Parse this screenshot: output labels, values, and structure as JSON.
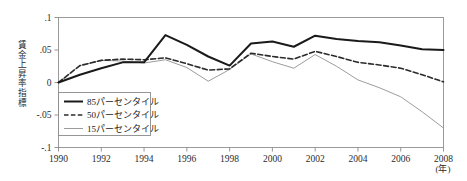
{
  "chart_data": {
    "type": "line",
    "title": "",
    "xlabel": "(年)",
    "ylabel": "賃金上昇率指標",
    "xlim": [
      1990,
      2008
    ],
    "ylim": [
      -0.1,
      0.1
    ],
    "grid": false,
    "legend_position": "lower-left-inside",
    "x": [
      1990,
      1991,
      1992,
      1993,
      1994,
      1995,
      1996,
      1997,
      1998,
      1999,
      2000,
      2001,
      2002,
      2003,
      2004,
      2005,
      2006,
      2007,
      2008
    ],
    "xticks": [
      "1990",
      "1992",
      "1994",
      "1996",
      "1998",
      "2000",
      "2002",
      "2004",
      "2006",
      "2008"
    ],
    "xtick_values": [
      1990,
      1992,
      1994,
      1996,
      1998,
      2000,
      2002,
      2004,
      2006,
      2008
    ],
    "yticks": [
      ".1",
      ".05",
      "0",
      "-.05",
      "-.1"
    ],
    "ytick_values": [
      0.1,
      0.05,
      0,
      -0.05,
      -0.1
    ],
    "series": [
      {
        "name": "85パーセンタイル",
        "style": "solid-thick",
        "color": "#1a1a1a",
        "values": [
          0.0,
          0.012,
          0.022,
          0.031,
          0.031,
          0.073,
          0.058,
          0.04,
          0.026,
          0.06,
          0.063,
          0.055,
          0.072,
          0.067,
          0.064,
          0.062,
          0.057,
          0.051,
          0.05
        ]
      },
      {
        "name": "50パーセンタイル",
        "style": "dashed",
        "color": "#2b2b2b",
        "values": [
          0.0,
          0.026,
          0.034,
          0.036,
          0.035,
          0.038,
          0.029,
          0.019,
          0.021,
          0.045,
          0.04,
          0.036,
          0.048,
          0.04,
          0.031,
          0.027,
          0.022,
          0.012,
          0.001
        ]
      },
      {
        "name": "15パーセンタイル",
        "style": "solid-thin",
        "color": "#8a8a8a",
        "values": [
          0.0,
          0.026,
          0.034,
          0.033,
          0.03,
          0.035,
          0.023,
          0.002,
          0.02,
          0.044,
          0.032,
          0.022,
          0.043,
          0.025,
          0.004,
          -0.008,
          -0.022,
          -0.045,
          -0.07
        ]
      }
    ]
  },
  "legend": {
    "items": [
      {
        "label": "85パーセンタイル",
        "style": "solid-thick"
      },
      {
        "label": "50パーセンタイル",
        "style": "dashed"
      },
      {
        "label": "15パーセンタイル",
        "style": "solid-thin"
      }
    ]
  },
  "axes": {
    "y_axis_label": "賃金上昇率指標",
    "x_axis_unit": "(年)"
  }
}
